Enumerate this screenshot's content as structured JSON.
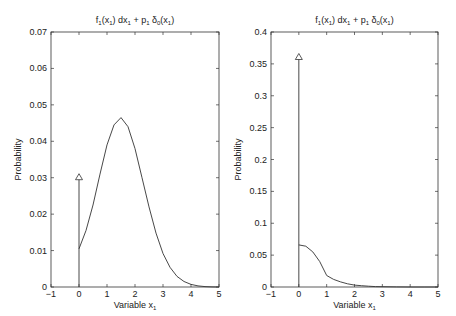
{
  "chart_data": [
    {
      "type": "line",
      "title": "f_1(x_1) dx_1 + p_1 δ_0(x_1)",
      "title_parts": {
        "f": "f",
        "f_sub": "1",
        "arg1": "(x",
        "arg1_sub": "1",
        "mid": ") dx",
        "dx_sub": "1",
        "plus": " + p",
        "p_sub": "1",
        "delta": " δ",
        "delta_sub": "0",
        "arg2": "(x",
        "arg2_sub": "1",
        "end": ")"
      },
      "xlabel": "Variable x_1",
      "xlabel_main": "Variable x",
      "xlabel_sub": "1",
      "ylabel": "Probability",
      "xlim": [
        -1,
        5
      ],
      "ylim": [
        0,
        0.07
      ],
      "xticks": [
        "-1",
        "0",
        "1",
        "2",
        "3",
        "4",
        "5"
      ],
      "yticks": [
        "0",
        "0.01",
        "0.02",
        "0.03",
        "0.04",
        "0.05",
        "0.06",
        "0.07"
      ],
      "grid": false,
      "impulse": {
        "x": 0,
        "height": 0.03,
        "marker": "triangle"
      },
      "series": [
        {
          "name": "density",
          "x": [
            0,
            0.25,
            0.5,
            0.75,
            1.0,
            1.25,
            1.5,
            1.75,
            2.0,
            2.25,
            2.5,
            2.75,
            3.0,
            3.25,
            3.5,
            3.75,
            4.0,
            4.25,
            4.5,
            4.75,
            5.0
          ],
          "y": [
            0.0105,
            0.0155,
            0.0225,
            0.031,
            0.039,
            0.0445,
            0.0465,
            0.044,
            0.038,
            0.03,
            0.022,
            0.0148,
            0.0092,
            0.0054,
            0.0029,
            0.0015,
            0.0007,
            0.0003,
            0.0001,
            3e-05,
            0.0
          ]
        }
      ]
    },
    {
      "type": "line",
      "title": "f_1(x_1) dx_1 + p_1 δ_0(x_1)",
      "title_parts": {
        "f": "f",
        "f_sub": "1",
        "arg1": "(x",
        "arg1_sub": "1",
        "mid": ") dx",
        "dx_sub": "1",
        "plus": " + p",
        "p_sub": "1",
        "delta": " δ",
        "delta_sub": "0",
        "arg2": "(x",
        "arg2_sub": "1",
        "end": ")"
      },
      "xlabel": "Variable x_1",
      "xlabel_main": "Variable x",
      "xlabel_sub": "1",
      "ylabel": "Probability",
      "xlim": [
        -1,
        5
      ],
      "ylim": [
        0,
        0.4
      ],
      "xticks": [
        "-1",
        "0",
        "1",
        "2",
        "3",
        "4",
        "5"
      ],
      "yticks": [
        "0",
        "0.05",
        "0.1",
        "0.15",
        "0.2",
        "0.25",
        "0.3",
        "0.35",
        "0.4"
      ],
      "grid": false,
      "impulse": {
        "x": 0,
        "height": 0.36,
        "marker": "triangle"
      },
      "series": [
        {
          "name": "density",
          "x": [
            0,
            0.25,
            0.5,
            0.75,
            1.0,
            1.25,
            1.5,
            1.75,
            2.0,
            2.25,
            2.5,
            2.75,
            3.0,
            3.5,
            4.0,
            4.5,
            5.0
          ],
          "y": [
            0.066,
            0.064,
            0.055,
            0.04,
            0.018,
            0.012,
            0.008,
            0.005,
            0.003,
            0.002,
            0.0012,
            0.0007,
            0.0004,
            0.0001,
            3e-05,
            0.0,
            0.0
          ]
        }
      ]
    }
  ]
}
